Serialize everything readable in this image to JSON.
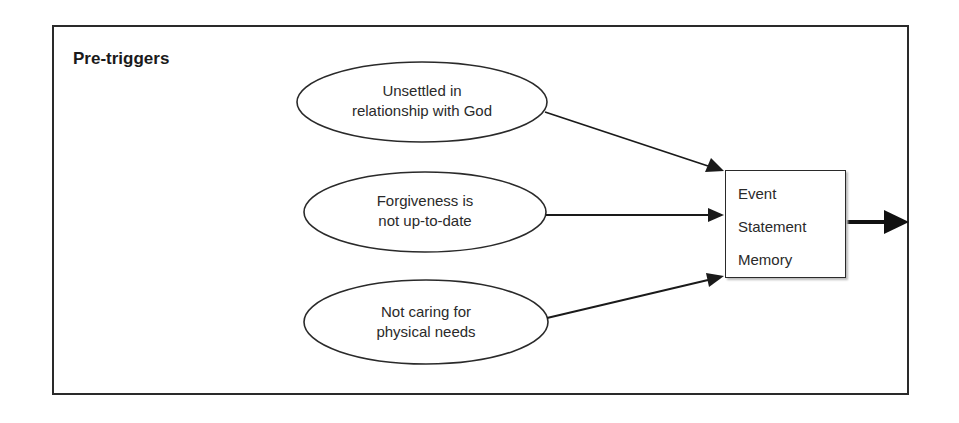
{
  "diagram": {
    "title": "Pre-triggers",
    "nodes": [
      {
        "id": "n1",
        "shape": "ellipse",
        "lines": [
          "Unsettled in",
          "relationship with God"
        ]
      },
      {
        "id": "n2",
        "shape": "ellipse",
        "lines": [
          "Forgiveness is",
          "not up-to-date"
        ]
      },
      {
        "id": "n3",
        "shape": "ellipse",
        "lines": [
          "Not caring for",
          "physical needs"
        ]
      }
    ],
    "target_box": {
      "lines": [
        "Event",
        "Statement",
        "Memory"
      ]
    },
    "edges": [
      {
        "from": "n1",
        "to": "target_box"
      },
      {
        "from": "n2",
        "to": "target_box"
      },
      {
        "from": "n3",
        "to": "target_box"
      },
      {
        "from": "target_box",
        "to": "outside",
        "style": "bold"
      }
    ],
    "colors": {
      "stroke": "#2a2a2a",
      "background": "#ffffff"
    }
  }
}
